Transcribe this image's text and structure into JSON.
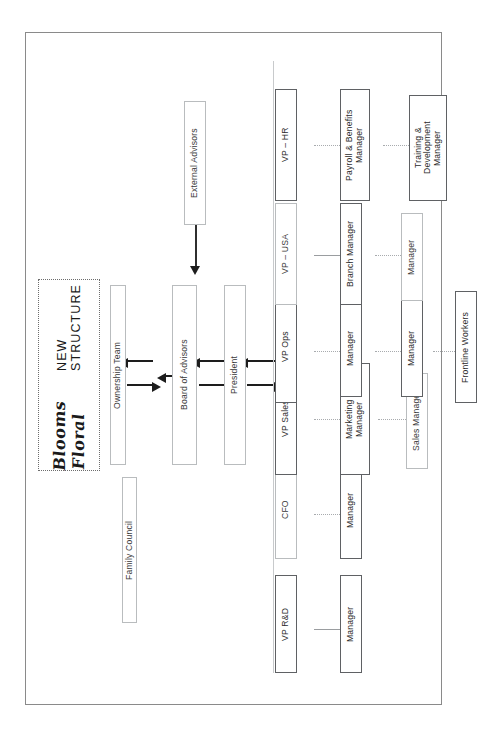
{
  "document": {
    "title_brand": "Blooms Floral",
    "title_sub": "NEW STRUCTURE"
  },
  "governance": {
    "family_council": "Family Council",
    "ownership_team": "Ownership Team",
    "board_of_advisors": "Board of Advisors",
    "external_advisors": "External Advisors",
    "president": "President"
  },
  "branches": [
    {
      "head": "VP R&D",
      "reports": [
        "Manager"
      ]
    },
    {
      "head": "CFO",
      "reports": [
        "Manager"
      ]
    },
    {
      "head": "VP Sales",
      "reports": [
        "Marketing\nManager",
        "Sales Manager"
      ]
    },
    {
      "head": "VP Ops",
      "reports": [
        "Manager",
        "Manager",
        "Frontline Workers"
      ]
    },
    {
      "head": "VP – USA",
      "reports": [
        "Branch Manager",
        "Manager"
      ]
    },
    {
      "head": "VP – HR",
      "reports": [
        "Payroll & Benefits\nManager",
        "Training &\nDevelopment\nManager"
      ]
    }
  ],
  "colors": {
    "frame": "#8a8a8a",
    "node_thin_border": "#b9bcbe",
    "node_thick_border": "#5f6164",
    "connector": "#9a9da0",
    "arrow": "#1d1d1d",
    "text": "#231f20"
  }
}
